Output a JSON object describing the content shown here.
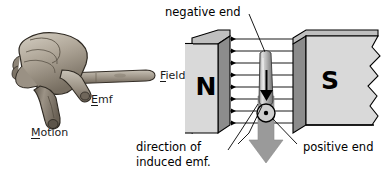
{
  "figure": {
    "background_color": "#ffffff"
  },
  "hand_diagram": {
    "name": "right-hand-rule",
    "labels": {
      "field": "Field",
      "field_mnemonic_letter": "F",
      "emf": "Emf",
      "emf_mnemonic_letter": "E",
      "motion": "Motion",
      "motion_mnemonic_letter": "M"
    },
    "colors": {
      "skin_light": "#cfc9bd",
      "skin_mid": "#a89f91",
      "skin_dark": "#6f665a",
      "outline": "#2b2721"
    }
  },
  "magnet_diagram": {
    "name": "magnet-field-diagram",
    "poles": {
      "north_label": "N",
      "south_label": "S"
    },
    "annotations": {
      "negative_end": "negative end",
      "positive_end": "positive end",
      "direction_line_1": "direction of",
      "direction_line_2": "induced emf."
    },
    "field_lines": {
      "count": 8,
      "direction": "left-to-right",
      "marker": "arrow-dot"
    },
    "conductor": {
      "name": "conductor-rod",
      "current_arrow_direction": "down",
      "terminal_symbol": "circle-dot"
    },
    "motion_arrow": {
      "name": "motion-arrow",
      "direction": "down",
      "color": "#9a9a9a"
    },
    "colors": {
      "magnet_face": "#d9d9d9",
      "magnet_side": "#8c8c8c",
      "magnet_top": "#bfbfbf",
      "outline": "#000000",
      "rod_light": "#d4d4d4",
      "rod_dark": "#8a8a8a"
    }
  }
}
